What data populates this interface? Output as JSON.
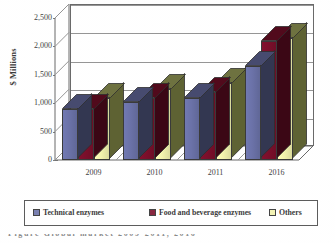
{
  "chart_data": {
    "type": "bar",
    "title": "",
    "xlabel": "",
    "ylabel": "$ Millions",
    "categories": [
      "2009",
      "2010",
      "2011",
      "2016"
    ],
    "ylim": [
      0,
      2500
    ],
    "yticks": [
      "0",
      "500",
      "1,000",
      "1,500",
      "2,000",
      "2,500"
    ],
    "ytick_values": [
      0,
      500,
      1000,
      1500,
      2000,
      2500
    ],
    "grid": true,
    "legend_position": "bottom",
    "three_d": true,
    "series": [
      {
        "name": "Technical enzymes",
        "color": "#6B72A8",
        "values": [
          900,
          1030,
          1100,
          1650
        ]
      },
      {
        "name": "Food and beverage enzymes",
        "color": "#7B0F2B",
        "values": [
          900,
          1100,
          1200,
          2100
        ]
      },
      {
        "name": "Others",
        "color": "#F2F2AD",
        "values": [
          1100,
          1250,
          1350,
          2150
        ]
      }
    ]
  },
  "legend": {
    "items": [
      {
        "label": "Technical enzymes",
        "color": "#6B72A8"
      },
      {
        "label": "Food and beverage enzymes",
        "color": "#7B0F2B"
      },
      {
        "label": "Others",
        "color": "#F2F2AD"
      }
    ]
  },
  "caption": {
    "cropped_text": "Figure  Global  market     2009-2011, 2016"
  },
  "colors": {
    "series_blue": "#6B72A8",
    "series_maroon": "#7B0F2B",
    "series_cream": "#F2F2AD",
    "axis": "#595959",
    "grid": "#8a8a8a",
    "text": "#262626",
    "background": "#ffffff"
  }
}
